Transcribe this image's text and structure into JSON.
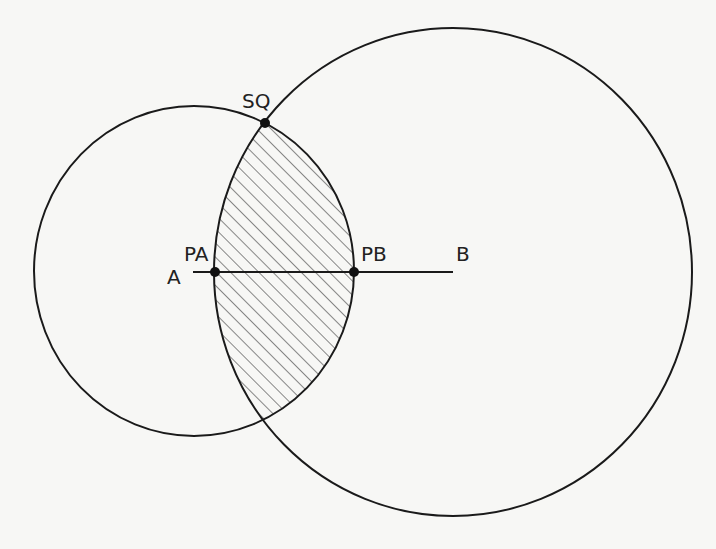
{
  "diagram": {
    "type": "geometry",
    "colors": {
      "stroke": "#1a1a1a",
      "hatch": "#555555",
      "background": "#f7f7f5"
    },
    "circles": [
      {
        "name": "circle-A",
        "cx": 194,
        "cy": 271,
        "rx": 160,
        "ry": 165
      },
      {
        "name": "circle-B",
        "cx": 453,
        "cy": 272,
        "rx": 239,
        "ry": 244
      }
    ],
    "segment": {
      "from": "A",
      "to": "B",
      "x1": 193,
      "y1": 272,
      "x2": 453,
      "y2": 272
    },
    "points": [
      {
        "label": "PA",
        "x": 215,
        "y": 272
      },
      {
        "label": "PB",
        "x": 354,
        "y": 272
      },
      {
        "label": "SQ",
        "x": 265,
        "y": 123
      }
    ],
    "hatched_region": "intersection of circle-A and circle-B",
    "labels": {
      "A": "A",
      "B": "B",
      "PA": "PA",
      "PB": "PB",
      "SQ": "SQ"
    }
  }
}
